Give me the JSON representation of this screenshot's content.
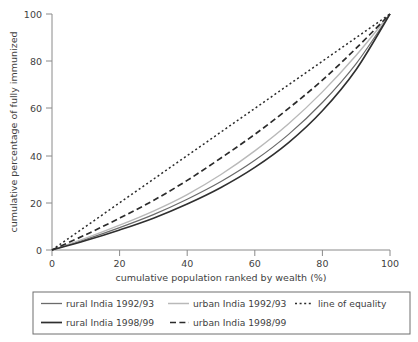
{
  "chart_data": {
    "type": "line",
    "title": "",
    "xlabel": "cumulative population ranked by wealth (%)",
    "ylabel": "cumulative percentage of fully immunized",
    "xlim": [
      0,
      100
    ],
    "ylim": [
      0,
      100
    ],
    "xticks": [
      "0",
      "20",
      "40",
      "60",
      "80",
      "100"
    ],
    "yticks": [
      "0",
      "20",
      "40",
      "60",
      "80",
      "100"
    ],
    "xtick_values": [
      0,
      20,
      40,
      60,
      80,
      100
    ],
    "ytick_values": [
      0,
      20,
      40,
      60,
      80,
      100
    ],
    "grid": false,
    "legend_position": "below-plot",
    "x": [
      0,
      10,
      20,
      30,
      40,
      50,
      60,
      70,
      80,
      90,
      100
    ],
    "series": [
      {
        "name": "rural India 1992/93",
        "style": "solid",
        "color": "#6b6b6b",
        "width": 1.2,
        "values": [
          0,
          4.5,
          9.5,
          15.0,
          21.5,
          29.0,
          38.0,
          49.0,
          62.5,
          79.0,
          100
        ]
      },
      {
        "name": "urban India 1992/93",
        "style": "solid",
        "color": "#b9b9b9",
        "width": 1.4,
        "values": [
          0,
          5.0,
          10.5,
          16.5,
          23.5,
          32.0,
          42.0,
          53.5,
          67.0,
          82.5,
          100
        ]
      },
      {
        "name": "line of equality",
        "style": "dotted",
        "color": "#2b2b2b",
        "width": 1.5,
        "values": [
          0,
          10,
          20,
          30,
          40,
          50,
          60,
          70,
          80,
          90,
          100
        ]
      },
      {
        "name": "rural India 1998/99",
        "style": "solid",
        "color": "#2f2f2f",
        "width": 1.6,
        "values": [
          0,
          4.0,
          8.5,
          13.5,
          19.5,
          26.5,
          35.0,
          45.5,
          59.0,
          76.5,
          100
        ]
      },
      {
        "name": "urban India 1998/99",
        "style": "dashed",
        "color": "#2b2b2b",
        "width": 1.7,
        "values": [
          0,
          6.5,
          13.5,
          21.0,
          29.5,
          39.0,
          49.0,
          60.0,
          72.0,
          85.5,
          100
        ]
      }
    ]
  },
  "axes": {
    "xlabel": "cumulative population ranked by wealth (%)",
    "ylabel": "cumulative percentage of fully immunized",
    "xticks": [
      "0",
      "20",
      "40",
      "60",
      "80",
      "100"
    ],
    "yticks": [
      "0",
      "20",
      "40",
      "60",
      "80",
      "100"
    ]
  },
  "legend": {
    "entries": [
      {
        "label": "rural India 1992/93",
        "marker": "solid-gray-line"
      },
      {
        "label": "urban India 1992/93",
        "marker": "solid-lightgray-line"
      },
      {
        "label": "line of equality",
        "marker": "dotted-line"
      },
      {
        "label": "rural India 1998/99",
        "marker": "solid-black-line"
      },
      {
        "label": "urban India 1998/99",
        "marker": "dashed-black-line"
      }
    ]
  },
  "colors": {
    "rural_1992": "#6b6b6b",
    "urban_1992": "#b9b9b9",
    "rural_1998": "#2f2f2f",
    "urban_1998": "#2b2b2b",
    "equality": "#2b2b2b",
    "axis": "#8a8a8a",
    "text": "#3f3f3f",
    "background": "#ffffff"
  }
}
